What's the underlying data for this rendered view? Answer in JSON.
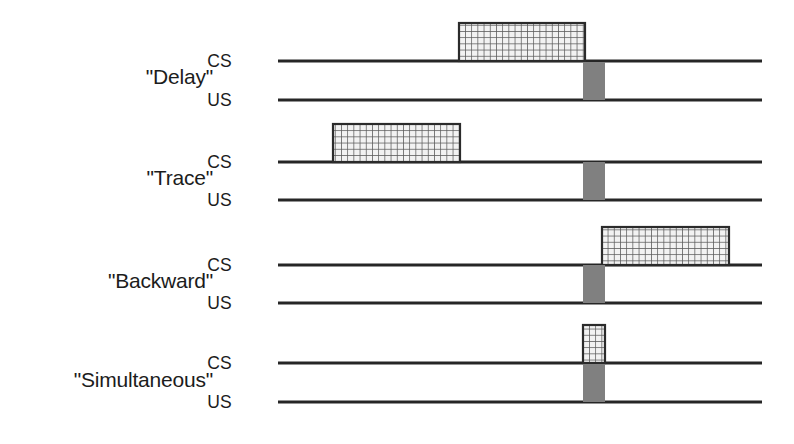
{
  "figure": {
    "channel_labels": {
      "cs": "CS",
      "us": "US"
    },
    "colors": {
      "background": "#ffffff",
      "line": "#262626",
      "text": "#1c1c1c",
      "cs_fill": "#f2f2f2",
      "cs_hatch": "#5a5a5a",
      "cs_border": "#2b2b2b",
      "us_fill": "#808080"
    },
    "geometry": {
      "timeline_x_start": 278,
      "timeline_x_end": 762,
      "label_x_right": 213,
      "channel_label_x": 232,
      "bar_height": 38
    },
    "rows": [
      {
        "id": "delay",
        "label": "\"Delay\"",
        "label_y": 84,
        "cs": {
          "baseline_y": 61,
          "bar": {
            "x": 459,
            "width": 126
          }
        },
        "us": {
          "baseline_y": 100,
          "bar": {
            "x": 583,
            "width": 22
          }
        }
      },
      {
        "id": "trace",
        "label": "\"Trace\"",
        "label_y": 185,
        "cs": {
          "baseline_y": 162,
          "bar": {
            "x": 333,
            "width": 127
          }
        },
        "us": {
          "baseline_y": 200,
          "bar": {
            "x": 583,
            "width": 22
          }
        }
      },
      {
        "id": "backward",
        "label": "\"Backward\"",
        "label_y": 288,
        "cs": {
          "baseline_y": 265,
          "bar": {
            "x": 602,
            "width": 127
          }
        },
        "us": {
          "baseline_y": 303,
          "bar": {
            "x": 583,
            "width": 22
          }
        }
      },
      {
        "id": "simultaneous",
        "label": "\"Simultaneous\"",
        "label_y": 387,
        "cs": {
          "baseline_y": 363,
          "bar": {
            "x": 583,
            "width": 22
          }
        },
        "us": {
          "baseline_y": 402,
          "bar": {
            "x": 583,
            "width": 22
          }
        }
      }
    ]
  },
  "chart_data": {
    "type": "timeline",
    "xlabel": "",
    "ylabel": "",
    "grid": false,
    "legend_position": "none",
    "x_axis_units": "relative time (arbitrary units, pixels on timeline)",
    "timeline_range": [
      278,
      762
    ],
    "channels": [
      "CS",
      "US"
    ],
    "series": [
      {
        "name": "\"Delay\"",
        "description": "CS begins before the US and continues until the US onset; the two stimuli overlap and terminate together.",
        "events": [
          {
            "channel": "CS",
            "onset": 459,
            "offset": 585,
            "duration": 126,
            "fill": "crosshatch"
          },
          {
            "channel": "US",
            "onset": 583,
            "offset": 605,
            "duration": 22,
            "fill": "solid-gray"
          }
        ]
      },
      {
        "name": "\"Trace\"",
        "description": "CS begins and ends well before the US onset, leaving an empty trace interval between them.",
        "events": [
          {
            "channel": "CS",
            "onset": 333,
            "offset": 460,
            "duration": 127,
            "fill": "crosshatch"
          },
          {
            "channel": "US",
            "onset": 583,
            "offset": 605,
            "duration": 22,
            "fill": "solid-gray"
          }
        ]
      },
      {
        "name": "\"Backward\"",
        "description": "US is presented first and the CS follows after the US terminates.",
        "events": [
          {
            "channel": "CS",
            "onset": 602,
            "offset": 729,
            "duration": 127,
            "fill": "crosshatch"
          },
          {
            "channel": "US",
            "onset": 583,
            "offset": 605,
            "duration": 22,
            "fill": "solid-gray"
          }
        ]
      },
      {
        "name": "\"Simultaneous\"",
        "description": "CS and US begin and end at the same moment.",
        "events": [
          {
            "channel": "CS",
            "onset": 583,
            "offset": 605,
            "duration": 22,
            "fill": "crosshatch"
          },
          {
            "channel": "US",
            "onset": 583,
            "offset": 605,
            "duration": 22,
            "fill": "solid-gray"
          }
        ]
      }
    ]
  }
}
